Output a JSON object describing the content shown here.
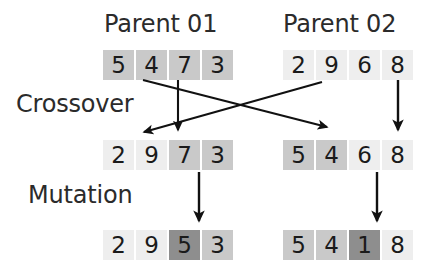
{
  "diagram": {
    "title_left": "Parent 01",
    "title_right": "Parent 02",
    "stage_crossover": "Crossover",
    "stage_mutation": "Mutation",
    "colors": {
      "light": "#eeeeee",
      "mid": "#c9c9c9",
      "dark": "#8e8e8e",
      "text": "#1a1a1a",
      "label_text": "#2b2b2b",
      "arrow": "#111111",
      "background": "#ffffff"
    },
    "rows": [
      {
        "name": "parents",
        "left": {
          "label": "Parent 01",
          "cells": [
            {
              "value": "5",
              "shade": "mid"
            },
            {
              "value": "4",
              "shade": "mid"
            },
            {
              "value": "7",
              "shade": "mid"
            },
            {
              "value": "3",
              "shade": "mid"
            }
          ]
        },
        "right": {
          "label": "Parent 02",
          "cells": [
            {
              "value": "2",
              "shade": "light"
            },
            {
              "value": "9",
              "shade": "light"
            },
            {
              "value": "6",
              "shade": "light"
            },
            {
              "value": "8",
              "shade": "light"
            }
          ]
        }
      },
      {
        "name": "offspring",
        "left": {
          "label": "Offspring 01",
          "cells": [
            {
              "value": "2",
              "shade": "light"
            },
            {
              "value": "9",
              "shade": "light"
            },
            {
              "value": "7",
              "shade": "mid"
            },
            {
              "value": "3",
              "shade": "mid"
            }
          ]
        },
        "right": {
          "label": "Offspring 02",
          "cells": [
            {
              "value": "5",
              "shade": "mid"
            },
            {
              "value": "4",
              "shade": "mid"
            },
            {
              "value": "6",
              "shade": "light"
            },
            {
              "value": "8",
              "shade": "light"
            }
          ]
        }
      },
      {
        "name": "mutated",
        "left": {
          "label": "Mutated 01",
          "cells": [
            {
              "value": "2",
              "shade": "light"
            },
            {
              "value": "9",
              "shade": "light"
            },
            {
              "value": "5",
              "shade": "dark"
            },
            {
              "value": "3",
              "shade": "mid"
            }
          ]
        },
        "right": {
          "label": "Mutated 02",
          "cells": [
            {
              "value": "5",
              "shade": "mid"
            },
            {
              "value": "4",
              "shade": "mid"
            },
            {
              "value": "1",
              "shade": "dark"
            },
            {
              "value": "8",
              "shade": "light"
            }
          ]
        }
      }
    ],
    "arrows": [
      {
        "name": "crossover-arrow-p1-to-offspring02",
        "from": [
          143,
          80
        ],
        "to": [
          330,
          128
        ]
      },
      {
        "name": "crossover-arrow-p2-to-offspring01",
        "from": [
          322,
          82
        ],
        "to": [
          140,
          133
        ]
      },
      {
        "name": "crossover-arrow-p1-down",
        "from": [
          178,
          80
        ],
        "to": [
          178,
          131
        ]
      },
      {
        "name": "crossover-arrow-p2-down",
        "from": [
          398,
          80
        ],
        "to": [
          398,
          131
        ]
      },
      {
        "name": "mutation-arrow-left",
        "from": [
          199,
          172
        ],
        "to": [
          199,
          222
        ]
      },
      {
        "name": "mutation-arrow-right",
        "from": [
          377,
          172
        ],
        "to": [
          377,
          222
        ]
      }
    ]
  }
}
